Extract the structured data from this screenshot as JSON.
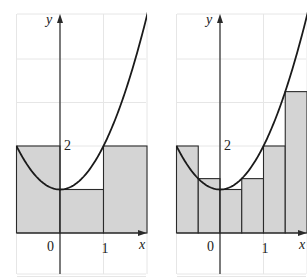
{
  "figure": {
    "function": "x^2 + 1",
    "colors": {
      "fill": "#d4d4d4",
      "stroke": "#2a2a2a",
      "grid": "#e6e6e6",
      "curve": "#1a1a1a"
    }
  },
  "panels": [
    {
      "name": "n3",
      "axis_labels": {
        "x": "x",
        "y": "y"
      },
      "tick_labels": {
        "origin": "0",
        "x1": "1",
        "y2": "2"
      },
      "delta_x": 1,
      "rectangles": [
        {
          "x0": -1,
          "x1": 0,
          "height": 2
        },
        {
          "x0": 0,
          "x1": 1,
          "height": 1
        },
        {
          "x0": 1,
          "x1": 2,
          "height": 2
        }
      ]
    },
    {
      "name": "n6",
      "axis_labels": {
        "x": "x",
        "y": "y"
      },
      "tick_labels": {
        "origin": "0",
        "x1": "1",
        "y2": "2"
      },
      "delta_x": 0.5,
      "rectangles": [
        {
          "x0": -1,
          "x1": -0.5,
          "height": 2
        },
        {
          "x0": -0.5,
          "x1": 0,
          "height": 1.25
        },
        {
          "x0": 0,
          "x1": 0.5,
          "height": 1
        },
        {
          "x0": 0.5,
          "x1": 1,
          "height": 1.25
        },
        {
          "x0": 1,
          "x1": 1.5,
          "height": 2
        },
        {
          "x0": 1.5,
          "x1": 2,
          "height": 3.25
        }
      ]
    }
  ]
}
